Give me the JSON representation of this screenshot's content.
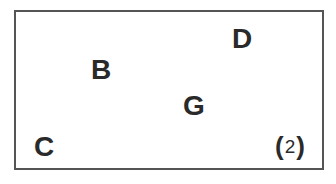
{
  "diagram": {
    "panel_number": {
      "open": "(",
      "value": "2",
      "close": ")"
    },
    "labels": [
      {
        "id": "D",
        "text": "D"
      },
      {
        "id": "B",
        "text": "B"
      },
      {
        "id": "G",
        "text": "G"
      },
      {
        "id": "C",
        "text": "C"
      }
    ]
  },
  "colors": {
    "border": "#555555",
    "text": "#2a2a2a",
    "background": "#ffffff"
  }
}
